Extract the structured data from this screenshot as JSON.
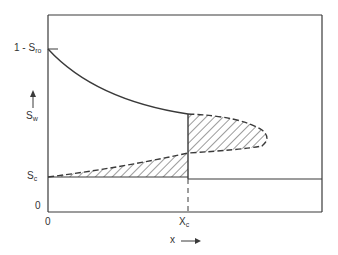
{
  "diagram": {
    "type": "saturation-profile",
    "y_axis": {
      "label_main": "S",
      "label_sub": "w",
      "arrow": "up-arrow",
      "ticks": [
        {
          "main": "1 - S",
          "sub": "ro",
          "position": "top"
        },
        {
          "main": "S",
          "sub": "c",
          "position": "lower"
        },
        {
          "main": "0",
          "sub": "",
          "position": "origin"
        }
      ]
    },
    "x_axis": {
      "label": "x",
      "arrow": "right-arrow",
      "ticks": [
        {
          "main": "0",
          "sub": "",
          "position": "origin"
        },
        {
          "main": "X",
          "sub": "c",
          "position": "middle"
        }
      ]
    },
    "elements": [
      "upper-saturation-curve",
      "lower-dashed-saturation-curve",
      "vertical-shock-front-at-xc",
      "hatched-region-below-front",
      "hatched-region-beyond-front",
      "horizontal-line-after-xc"
    ],
    "colors": {
      "line": "#3a3a3a",
      "background": "#ffffff"
    }
  }
}
